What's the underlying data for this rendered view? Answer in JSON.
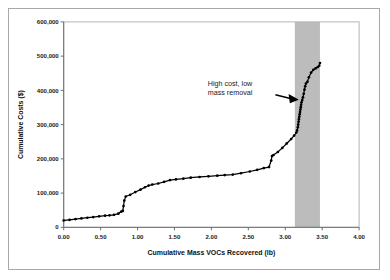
{
  "chart_data": {
    "type": "line",
    "title": "",
    "xlabel": "Cumulative Mass VOCs Recovered (lb)",
    "ylabel": "Cumulative Costs ($)",
    "xlim": [
      0.0,
      4.0
    ],
    "ylim": [
      0,
      600000
    ],
    "xticks": [
      0.0,
      0.5,
      1.0,
      1.5,
      2.0,
      2.5,
      3.0,
      3.5,
      4.0
    ],
    "xtick_labels": [
      "0.00",
      "0.50",
      "1.00",
      "1.50",
      "2.00",
      "2.50",
      "3.00",
      "3.50",
      "4.00"
    ],
    "yticks": [
      0,
      100000,
      200000,
      300000,
      400000,
      500000,
      600000
    ],
    "ytick_labels": [
      "0",
      "100,000",
      "200,000",
      "300,000",
      "400,000",
      "500,000",
      "600,000"
    ],
    "grid": false,
    "legend": null,
    "marker": "filled-circle",
    "line_color": "#000000",
    "series": [
      {
        "name": "Cumulative cost vs cumulative VOC mass recovered",
        "x": [
          0.0,
          0.08,
          0.16,
          0.24,
          0.32,
          0.4,
          0.48,
          0.56,
          0.62,
          0.68,
          0.74,
          0.78,
          0.8,
          0.81,
          0.82,
          0.84,
          0.9,
          0.97,
          1.04,
          1.1,
          1.15,
          1.2,
          1.28,
          1.36,
          1.44,
          1.52,
          1.62,
          1.72,
          1.84,
          1.96,
          2.08,
          2.18,
          2.29,
          2.4,
          2.52,
          2.62,
          2.71,
          2.78,
          2.81,
          2.82,
          2.84,
          2.9,
          2.96,
          3.02,
          3.08,
          3.12,
          3.15,
          3.16,
          3.17,
          3.175,
          3.18,
          3.185,
          3.19,
          3.195,
          3.2,
          3.205,
          3.21,
          3.215,
          3.22,
          3.23,
          3.24,
          3.25,
          3.26,
          3.27,
          3.28,
          3.3,
          3.32,
          3.35,
          3.38,
          3.41,
          3.44,
          3.46,
          3.47
        ],
        "y": [
          20000,
          22000,
          24000,
          26000,
          28000,
          30000,
          32000,
          34000,
          35000,
          36500,
          40000,
          46000,
          48000,
          62000,
          78000,
          90000,
          95000,
          103000,
          110000,
          117000,
          122000,
          125000,
          128000,
          133000,
          138000,
          140000,
          142000,
          145000,
          147000,
          149000,
          151000,
          152500,
          154000,
          158000,
          163000,
          168000,
          173000,
          176000,
          195000,
          208000,
          211000,
          220000,
          232000,
          245000,
          258000,
          268000,
          277000,
          283000,
          292000,
          300000,
          308000,
          316000,
          323000,
          330000,
          337000,
          344000,
          351000,
          358000,
          365000,
          372000,
          380000,
          390000,
          402000,
          412000,
          420000,
          425000,
          438000,
          452000,
          460000,
          464000,
          468000,
          472000,
          480000
        ]
      }
    ],
    "shaded_band": {
      "label": "high-cost-low-mass-region",
      "x_start": 3.13,
      "x_end": 3.47,
      "color": "#b0b0b0"
    },
    "annotations": [
      {
        "name": "high-cost-callout",
        "line1": "High cost, low",
        "line2": "mass removal",
        "arrow_direction": "right",
        "points_to_x": 3.19,
        "points_to_y": 390000
      }
    ]
  }
}
